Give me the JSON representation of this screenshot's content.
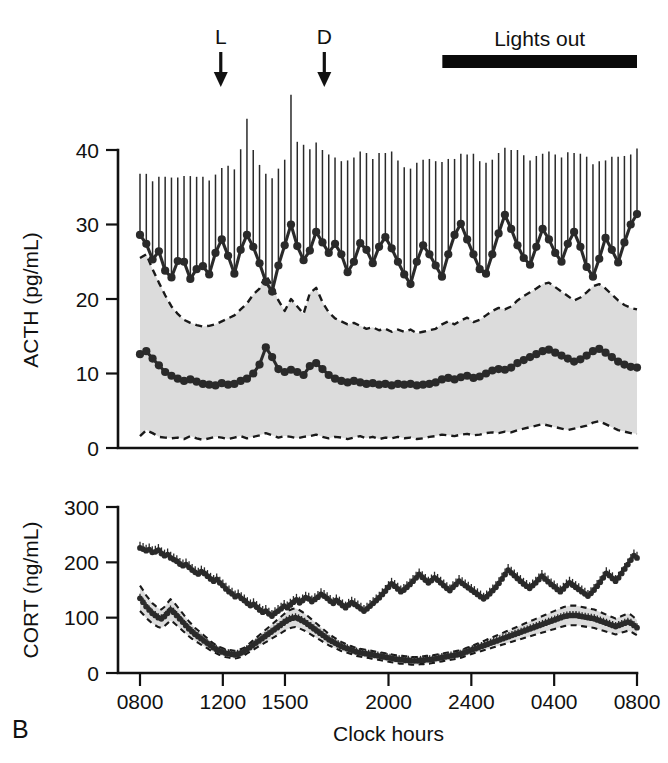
{
  "figure": {
    "panel_label": "B",
    "annotations": {
      "light_on_marker": "L",
      "dark_onset_marker": "D",
      "lights_out_label": "Lights out"
    }
  },
  "chart_data": [
    {
      "type": "line",
      "id": "acth-panel",
      "title": "",
      "ylabel": "ACTH (pg/mL)",
      "xlabel": "",
      "ylim": [
        0,
        44
      ],
      "yticks": [
        0,
        10,
        20,
        30,
        40
      ],
      "ytick_labels": [
        "0",
        "10",
        "20",
        "30",
        "40"
      ],
      "xlim_hours": [
        8.0,
        32.0
      ],
      "xticks_hours": [
        8,
        12,
        15,
        20,
        24,
        28,
        32
      ],
      "xtick_labels": [
        "0800",
        "1200",
        "1500",
        "2000",
        "2400",
        "0400",
        "0800"
      ],
      "grid": false,
      "legend": null,
      "annotations": [
        {
          "label": "L",
          "x_hour": 11.9,
          "kind": "down-arrow"
        },
        {
          "label": "D",
          "x_hour": 16.9,
          "kind": "down-arrow"
        },
        {
          "label": "Lights out",
          "x_start_hour": 22.6,
          "x_end_hour": 32.0,
          "kind": "bar"
        }
      ],
      "series": [
        {
          "name": "ACTH high-responder (mean +SEM)",
          "marker": "filled-circle",
          "errorbars": "upper-only",
          "values": [
            28.6,
            27.4,
            25.3,
            26.4,
            23.8,
            22.9,
            25.1,
            25.0,
            22.7,
            24.0,
            24.4,
            23.3,
            26.2,
            28.0,
            25.8,
            23.4,
            26.6,
            28.6,
            27.0,
            24.8,
            22.3,
            21.0,
            24.5,
            27.2,
            30.0,
            27.1,
            25.2,
            26.5,
            29.0,
            27.6,
            26.2,
            27.4,
            26.0,
            23.6,
            25.0,
            27.5,
            26.6,
            24.8,
            27.0,
            28.3,
            26.8,
            25.0,
            23.3,
            22.0,
            25.0,
            27.2,
            26.0,
            24.5,
            23.0,
            26.0,
            28.6,
            30.1,
            28.0,
            26.0,
            24.0,
            23.4,
            26.0,
            28.8,
            31.3,
            29.4,
            27.2,
            25.5,
            24.6,
            27.0,
            29.4,
            28.0,
            26.2,
            25.0,
            27.4,
            29.0,
            27.0,
            24.3,
            23.0,
            25.4,
            28.2,
            26.6,
            24.9,
            27.6,
            30.0,
            31.4
          ],
          "sem_upper": [
            8.2,
            9.4,
            10.5,
            10.0,
            12.6,
            13.4,
            11.2,
            11.5,
            13.8,
            12.4,
            12.0,
            12.6,
            10.5,
            9.6,
            12.1,
            14.0,
            13.5,
            15.6,
            13.0,
            13.2,
            14.5,
            15.2,
            13.0,
            11.5,
            17.4,
            14.0,
            15.5,
            13.6,
            12.0,
            12.4,
            13.2,
            11.6,
            12.5,
            15.0,
            14.0,
            12.3,
            13.0,
            14.0,
            12.6,
            11.3,
            13.0,
            13.6,
            14.4,
            15.5,
            13.3,
            11.5,
            12.8,
            14.0,
            15.4,
            12.8,
            10.2,
            9.4,
            11.4,
            13.5,
            14.5,
            14.9,
            12.7,
            10.8,
            9.0,
            10.6,
            12.8,
            13.8,
            14.0,
            12.2,
            10.1,
            11.8,
            13.2,
            14.0,
            12.3,
            10.6,
            12.5,
            14.8,
            15.1,
            13.1,
            10.4,
            12.5,
            14.2,
            11.6,
            9.4,
            8.8
          ]
        },
        {
          "name": "ACTH low-responder (mean, 95% band)",
          "marker": "filled-circle",
          "errorbars": "none",
          "band": "dashed-95-CI-shaded",
          "values": [
            12.6,
            13.0,
            12.0,
            11.1,
            10.2,
            9.7,
            9.3,
            9.0,
            9.2,
            8.9,
            8.6,
            8.5,
            8.4,
            8.7,
            8.5,
            8.6,
            9.0,
            9.3,
            10.0,
            11.2,
            13.5,
            12.2,
            10.6,
            10.2,
            10.5,
            10.2,
            9.8,
            11.0,
            11.4,
            10.6,
            9.8,
            9.3,
            9.0,
            8.8,
            9.0,
            8.8,
            8.6,
            8.7,
            8.5,
            8.6,
            8.4,
            8.6,
            8.5,
            8.6,
            8.4,
            8.5,
            8.6,
            8.8,
            9.2,
            9.4,
            9.2,
            9.5,
            9.7,
            9.4,
            9.6,
            10.0,
            10.4,
            10.6,
            10.5,
            10.8,
            11.4,
            11.8,
            12.2,
            12.6,
            13.0,
            13.2,
            12.8,
            12.4,
            12.0,
            11.6,
            11.9,
            12.4,
            13.0,
            13.3,
            12.8,
            12.2,
            11.6,
            11.2,
            10.9,
            10.8
          ],
          "band_upper": [
            25.5,
            26.0,
            24.0,
            22.2,
            20.5,
            19.0,
            18.0,
            17.2,
            16.8,
            16.5,
            16.3,
            16.4,
            16.6,
            17.0,
            17.4,
            17.8,
            18.6,
            19.4,
            20.6,
            21.4,
            23.2,
            21.8,
            19.8,
            18.4,
            20.0,
            19.0,
            18.0,
            20.8,
            21.5,
            19.6,
            18.2,
            17.4,
            17.0,
            16.6,
            16.8,
            16.4,
            16.0,
            16.2,
            15.8,
            16.0,
            15.6,
            15.9,
            15.6,
            15.9,
            15.4,
            15.6,
            15.8,
            16.0,
            16.6,
            17.0,
            16.6,
            17.1,
            17.5,
            16.9,
            17.2,
            17.8,
            18.4,
            18.8,
            18.6,
            19.0,
            19.8,
            20.4,
            20.9,
            21.4,
            22.0,
            22.2,
            21.6,
            21.0,
            20.4,
            19.8,
            20.2,
            20.9,
            21.7,
            22.0,
            21.4,
            20.6,
            19.8,
            19.2,
            18.8,
            18.6
          ],
          "band_lower": [
            1.6,
            2.4,
            2.0,
            1.5,
            1.4,
            1.3,
            1.4,
            1.2,
            1.6,
            1.3,
            1.1,
            1.3,
            1.5,
            1.4,
            1.2,
            1.4,
            1.6,
            1.3,
            1.5,
            1.7,
            2.0,
            1.7,
            1.4,
            1.6,
            1.5,
            1.3,
            1.5,
            1.6,
            1.8,
            1.5,
            1.3,
            1.5,
            1.4,
            1.2,
            1.4,
            1.6,
            1.3,
            1.5,
            1.2,
            1.4,
            1.3,
            1.5,
            1.3,
            1.4,
            1.2,
            1.3,
            1.5,
            1.6,
            1.8,
            1.7,
            1.6,
            1.8,
            1.9,
            1.7,
            1.8,
            2.0,
            2.1,
            2.0,
            2.2,
            2.1,
            2.4,
            2.6,
            2.8,
            3.0,
            3.2,
            3.0,
            2.8,
            2.6,
            2.4,
            2.6,
            2.8,
            3.0,
            3.4,
            3.6,
            3.2,
            2.8,
            2.4,
            2.2,
            2.0,
            1.9
          ]
        }
      ]
    },
    {
      "type": "line",
      "id": "cort-panel",
      "title": "",
      "ylabel": "CORT (ng/mL)",
      "xlabel": "Clock hours",
      "ylim": [
        0,
        310
      ],
      "yticks": [
        0,
        100,
        200,
        300
      ],
      "ytick_labels": [
        "0",
        "100",
        "200",
        "300"
      ],
      "xlim_hours": [
        8.0,
        32.0
      ],
      "xticks_hours": [
        8,
        12,
        15,
        20,
        24,
        28,
        32
      ],
      "xtick_labels": [
        "0800",
        "1200",
        "1500",
        "2000",
        "2400",
        "0400",
        "0800"
      ],
      "grid": false,
      "legend": null,
      "series": [
        {
          "name": "CORT high (mean +SEM)",
          "marker": "filled-circle",
          "errorbars": "small",
          "values": [
            226,
            224,
            221,
            223,
            218,
            219,
            222,
            216,
            212,
            214,
            208,
            205,
            202,
            197,
            194,
            196,
            191,
            186,
            182,
            179,
            183,
            180,
            175,
            170,
            166,
            169,
            163,
            158,
            152,
            147,
            143,
            138,
            140,
            135,
            131,
            126,
            122,
            124,
            119,
            114,
            110,
            112,
            107,
            103,
            108,
            112,
            116,
            121,
            118,
            123,
            128,
            132,
            127,
            131,
            136,
            134,
            129,
            133,
            137,
            142,
            139,
            135,
            130,
            126,
            131,
            127,
            122,
            118,
            123,
            127,
            124,
            120,
            116,
            112,
            116,
            121,
            126,
            131,
            136,
            142,
            148,
            155,
            161,
            157,
            152,
            147,
            150,
            155,
            160,
            166,
            172,
            178,
            173,
            168,
            163,
            167,
            172,
            168,
            163,
            158,
            153,
            149,
            155,
            160,
            166,
            162,
            158,
            154,
            150,
            146,
            142,
            138,
            134,
            138,
            143,
            149,
            155,
            162,
            170,
            178,
            186,
            181,
            176,
            171,
            166,
            161,
            157,
            153,
            158,
            163,
            169,
            175,
            170,
            165,
            160,
            156,
            151,
            147,
            152,
            158,
            163,
            159,
            155,
            151,
            147,
            143,
            139,
            144,
            150,
            157,
            164,
            172,
            180,
            176,
            171,
            166,
            172,
            180,
            188,
            196,
            204,
            212,
            208
          ]
        },
        {
          "name": "CORT low (mean, 95% band)",
          "marker": "filled-circle",
          "errorbars": "small",
          "band": "dashed-95-CI-shaded",
          "values": [
            135,
            128,
            120,
            114,
            108,
            104,
            100,
            98,
            102,
            108,
            114,
            110,
            104,
            98,
            92,
            86,
            80,
            75,
            70,
            66,
            62,
            58,
            54,
            50,
            46,
            43,
            40,
            38,
            36,
            35,
            34,
            33,
            34,
            36,
            38,
            42,
            46,
            50,
            54,
            58,
            62,
            66,
            70,
            74,
            78,
            82,
            86,
            90,
            94,
            97,
            99,
            100,
            98,
            95,
            92,
            88,
            84,
            80,
            76,
            72,
            68,
            64,
            60,
            57,
            54,
            51,
            48,
            46,
            44,
            42,
            40,
            38,
            37,
            36,
            35,
            34,
            33,
            32,
            31,
            30,
            29,
            28,
            27,
            26,
            25,
            24,
            24,
            23,
            23,
            22,
            22,
            22,
            23,
            23,
            24,
            24,
            25,
            26,
            27,
            28,
            29,
            30,
            31,
            32,
            33,
            34,
            36,
            38,
            40,
            42,
            44,
            46,
            48,
            50,
            52,
            54,
            56,
            58,
            60,
            62,
            64,
            66,
            68,
            70,
            72,
            74,
            76,
            78,
            80,
            82,
            84,
            86,
            88,
            90,
            92,
            94,
            96,
            98,
            100,
            102,
            103,
            104,
            104,
            104,
            103,
            102,
            101,
            100,
            99,
            98,
            96,
            94,
            92,
            90,
            88,
            86,
            84,
            86,
            88,
            90,
            92,
            90,
            86,
            82
          ]
        }
      ]
    }
  ]
}
